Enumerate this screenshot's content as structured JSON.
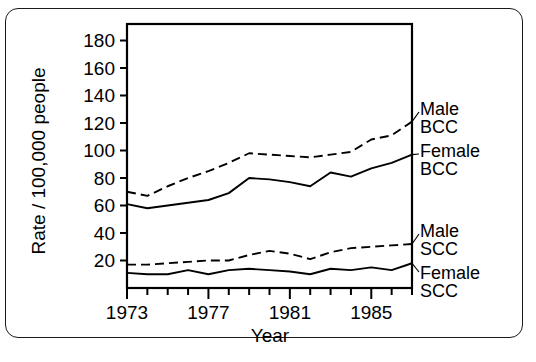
{
  "figure": {
    "ylabel": "Rate / 100,000 people",
    "xlabel": "Year"
  },
  "legend": {
    "items": [
      {
        "name": "male-bcc",
        "line1": "Male",
        "line2": "BCC"
      },
      {
        "name": "female-bcc",
        "line1": "Female",
        "line2": "BCC"
      },
      {
        "name": "male-scc",
        "line1": "Male",
        "line2": "SCC"
      },
      {
        "name": "female-scc",
        "line1": "Female",
        "line2": "SCC"
      }
    ]
  },
  "chart_data": {
    "type": "line",
    "title": "",
    "xlabel": "Year",
    "ylabel": "Rate / 100,000 people",
    "xlim": [
      1973,
      1987
    ],
    "ylim": [
      0,
      192
    ],
    "yticks": [
      20,
      40,
      60,
      80,
      100,
      120,
      140,
      160,
      180
    ],
    "xticks": [
      1973,
      1974,
      1975,
      1976,
      1977,
      1978,
      1979,
      1980,
      1981,
      1982,
      1983,
      1984,
      1985,
      1986,
      1987
    ],
    "xticklabels": [
      "1973",
      "",
      "",
      "",
      "1977",
      "",
      "",
      "",
      "1981",
      "",
      "",
      "",
      "1985",
      "",
      ""
    ],
    "grid": false,
    "legend_position": "right-outside",
    "x": [
      1973,
      1974,
      1975,
      1976,
      1977,
      1978,
      1979,
      1980,
      1981,
      1982,
      1983,
      1984,
      1985,
      1986,
      1987
    ],
    "series": [
      {
        "name": "Male BCC",
        "style": "dashed",
        "color": "#000000",
        "values": [
          70,
          67,
          74,
          80,
          85,
          91,
          98,
          97,
          96,
          95,
          97,
          99,
          108,
          111,
          121
        ]
      },
      {
        "name": "Female BCC",
        "style": "solid",
        "color": "#000000",
        "values": [
          61,
          58,
          60,
          62,
          64,
          69,
          80,
          79,
          77,
          74,
          84,
          81,
          87,
          91,
          97
        ]
      },
      {
        "name": "Male SCC",
        "style": "dashed",
        "color": "#000000",
        "values": [
          17,
          17,
          18,
          19,
          20,
          20,
          24,
          27,
          25,
          21,
          26,
          29,
          30,
          31,
          32
        ]
      },
      {
        "name": "Female SCC",
        "style": "solid",
        "color": "#000000",
        "values": [
          11,
          10,
          10,
          13,
          10,
          13,
          14,
          13,
          12,
          10,
          14,
          13,
          15,
          13,
          18
        ]
      }
    ]
  }
}
